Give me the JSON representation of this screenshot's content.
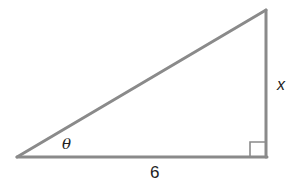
{
  "figure": {
    "type": "right-triangle",
    "colors": {
      "stroke": "#8a8a8a",
      "text": "#222222",
      "background": "#ffffff"
    },
    "vertices": {
      "left": [
        17,
        157
      ],
      "bottom_right": [
        267,
        158
      ],
      "top_right": [
        266,
        10
      ]
    },
    "right_angle_marker": {
      "at": "bottom_right",
      "size": 16
    },
    "labels": {
      "angle": "θ",
      "base": "6",
      "height": "x"
    }
  }
}
